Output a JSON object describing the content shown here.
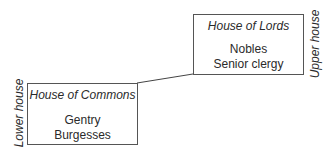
{
  "diagram": {
    "upper": {
      "title": "House of Lords",
      "members": [
        "Nobles",
        "Senior clergy"
      ],
      "side_label": "Upper house"
    },
    "lower": {
      "title": "House of Commons",
      "members": [
        "Gentry",
        "Burgesses"
      ],
      "side_label": "Lower house"
    }
  }
}
